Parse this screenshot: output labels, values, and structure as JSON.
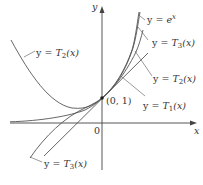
{
  "diagram": {
    "title": "",
    "axes": {
      "x_label": "x",
      "y_label": "y",
      "origin_label": "0"
    },
    "point": {
      "label": "(0, 1)"
    },
    "curves": [
      {
        "id": "exp",
        "label_prefix": "y = ",
        "label_fn": "e",
        "label_sup": "x",
        "label_suffix": ""
      },
      {
        "id": "T3_right",
        "label_prefix": "y = ",
        "label_fn": "T",
        "label_sub": "3",
        "label_suffix": "(x)"
      },
      {
        "id": "T2_right",
        "label_prefix": "y = ",
        "label_fn": "T",
        "label_sub": "2",
        "label_suffix": "(x)"
      },
      {
        "id": "T1",
        "label_prefix": "y = ",
        "label_fn": "T",
        "label_sub": "1",
        "label_suffix": "(x)"
      },
      {
        "id": "T2_left",
        "label_prefix": "y = ",
        "label_fn": "T",
        "label_sub": "2",
        "label_suffix": "(x)"
      },
      {
        "id": "T3_left",
        "label_prefix": "y = ",
        "label_fn": "T",
        "label_sub": "3",
        "label_suffix": "(x)"
      }
    ],
    "colors": {
      "curve": "#555555",
      "axis": "#444444",
      "text": "#333333",
      "background": "#ffffff"
    }
  }
}
